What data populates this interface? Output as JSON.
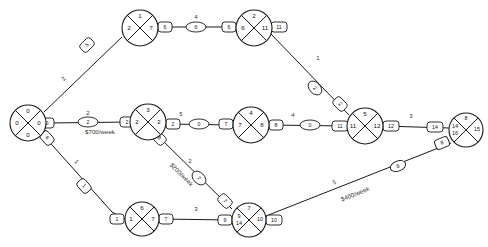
{
  "diagram": {
    "type": "activity-on-arrow-network",
    "accent_color": "#1a1a1a",
    "background_color": "#ffffff"
  },
  "nodes": [
    {
      "id": "n1",
      "label": "node-1",
      "cx": 28,
      "cy": 123,
      "r": 18,
      "top": "0",
      "left": "0",
      "right": "0",
      "bottom": "0",
      "left_sub": ""
    },
    {
      "id": "n2",
      "label": "node-2",
      "cx": 148,
      "cy": 122,
      "r": 18,
      "top": "3",
      "left": "2",
      "right": "2",
      "bottom": "",
      "left_sub": ""
    },
    {
      "id": "n3",
      "label": "node-3",
      "cx": 140,
      "cy": 28,
      "r": 18,
      "top": "1",
      "left": "2",
      "right": "7",
      "bottom": "",
      "left_sub": ""
    },
    {
      "id": "n4",
      "label": "node-4",
      "cx": 254,
      "cy": 28,
      "r": 18,
      "top": "2",
      "left": "6",
      "right": "11",
      "bottom": "",
      "left_sub": ""
    },
    {
      "id": "n5",
      "label": "node-5",
      "cx": 251,
      "cy": 125,
      "r": 18,
      "top": "4",
      "left": "7",
      "right": "8",
      "bottom": "",
      "left_sub": ""
    },
    {
      "id": "n6",
      "label": "node-6",
      "cx": 365,
      "cy": 126,
      "r": 18,
      "top": "5",
      "left": "11",
      "right": "12",
      "bottom": "",
      "left_sub": ""
    },
    {
      "id": "n7",
      "label": "node-7",
      "cx": 466,
      "cy": 130,
      "r": 17,
      "top": "8",
      "left": "14",
      "right": "15",
      "bottom": "",
      "left_sub": "16"
    },
    {
      "id": "n8",
      "label": "node-8",
      "cx": 142,
      "cy": 219,
      "r": 17,
      "top": "6",
      "left": "1",
      "right": "7",
      "bottom": "",
      "left_sub": ""
    },
    {
      "id": "n9",
      "label": "node-9",
      "cx": 249,
      "cy": 220,
      "r": 17,
      "top": "7",
      "left": "9",
      "right": "10",
      "bottom": "",
      "left_sub": "14"
    }
  ],
  "edges": [
    {
      "id": "e1",
      "name": "edge-n1-n3",
      "label": "2",
      "cost": "",
      "pills": [
        "5"
      ]
    },
    {
      "id": "e2",
      "name": "edge-n1-n2",
      "label": "2",
      "cost": "$700/week",
      "pills": [
        "0",
        "2",
        "2"
      ]
    },
    {
      "id": "e3",
      "name": "edge-n1-n8",
      "label": "1",
      "cost": "",
      "pills": [
        "6",
        "1"
      ]
    },
    {
      "id": "e4",
      "name": "edge-n3-n4",
      "label": "4",
      "cost": "",
      "pills": [
        "6",
        "6"
      ]
    },
    {
      "id": "e5",
      "name": "edge-n4-n6",
      "label": "1",
      "cost": "",
      "pills": [
        "11",
        "2"
      ]
    },
    {
      "id": "e6",
      "name": "edge-n2-n5",
      "label": "5",
      "cost": "",
      "pills": [
        "2",
        "0",
        "7"
      ]
    },
    {
      "id": "e7",
      "name": "edge-n2-n9",
      "label": "2",
      "cost": "$200/week",
      "pills": [
        "8",
        "7"
      ]
    },
    {
      "id": "e8",
      "name": "edge-n5-n6",
      "label": "4",
      "cost": "",
      "pills": [
        "8",
        "0",
        "11"
      ]
    },
    {
      "id": "e9",
      "name": "edge-n6-n7",
      "label": "3",
      "cost": "",
      "pills": [
        "12",
        "0",
        "14"
      ]
    },
    {
      "id": "e10",
      "name": "edge-n8-n9",
      "label": "3",
      "cost": "",
      "pills": [
        "7",
        "9"
      ]
    },
    {
      "id": "e11",
      "name": "edge-n9-n7",
      "label": "5",
      "cost": "$400/week",
      "pills": [
        "10",
        "8"
      ]
    }
  ],
  "labels": {
    "cost_n1_n2": "$700/week",
    "cost_n2_n9": "$200/week",
    "cost_n9_n7": "$400/week",
    "edge_1_3": "2",
    "edge_1_2": "2",
    "edge_1_8": "1",
    "edge_3_4": "4",
    "edge_4_6": "1",
    "edge_2_5": "5",
    "edge_2_9": "2",
    "edge_5_6": "4",
    "edge_6_7": "3",
    "edge_8_9": "3",
    "edge_9_7": "5"
  }
}
